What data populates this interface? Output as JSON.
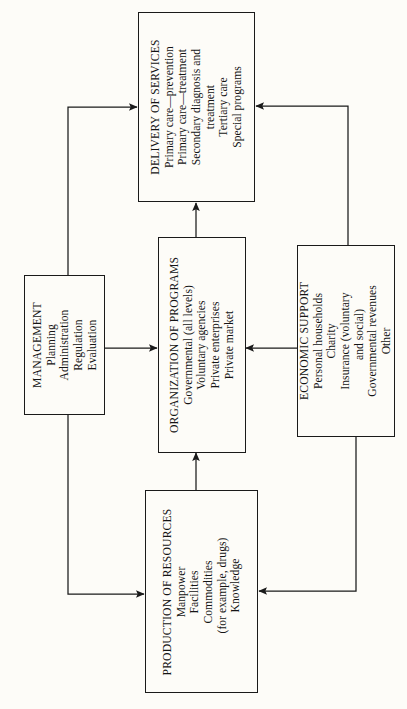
{
  "diagram": {
    "type": "flow-diagram",
    "orientation": "rotated-90-ccw",
    "background_color": "#fdfcf8",
    "line_color": "#1a1a1a",
    "nodes": [
      {
        "id": "delivery",
        "title": "DELIVERY OF SERVICES",
        "items": [
          "Primary care—prevention",
          "Primary care—treatment",
          "Secondary diagnosis and",
          "treatment",
          "Tertiary care",
          "Special programs"
        ]
      },
      {
        "id": "management",
        "title": "MANAGEMENT",
        "items": [
          "Planning",
          "Administration",
          "Regulation",
          "Evaluation"
        ]
      },
      {
        "id": "organization",
        "title": "ORGANIZATION OF PROGRAMS",
        "items": [
          "Governmental (all levels)",
          "Voluntary agencies",
          "Private enterprises",
          "Private market"
        ]
      },
      {
        "id": "economic",
        "title": "ECONOMIC SUPPORT",
        "items": [
          "Personal households",
          "Charity",
          "Insurance (voluntary",
          "and social)",
          "Governmental revenues",
          "Other"
        ]
      },
      {
        "id": "production",
        "title": "PRODUCTION OF RESOURCES",
        "items": [
          "Manpower",
          "Facilities",
          "Commodities",
          "(for example, drugs)",
          "Knowledge"
        ]
      }
    ],
    "edges": [
      {
        "from": "management",
        "to": "delivery"
      },
      {
        "from": "management",
        "to": "organization"
      },
      {
        "from": "management",
        "to": "production"
      },
      {
        "from": "organization",
        "to": "delivery"
      },
      {
        "from": "economic",
        "to": "delivery"
      },
      {
        "from": "economic",
        "to": "organization"
      },
      {
        "from": "economic",
        "to": "production"
      },
      {
        "from": "production",
        "to": "organization"
      }
    ]
  }
}
